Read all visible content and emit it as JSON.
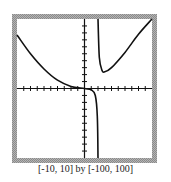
{
  "chart_data": {
    "type": "line",
    "title": "",
    "xlabel": "",
    "ylabel": "",
    "xlim": [
      -10,
      10
    ],
    "ylim": [
      -100,
      100
    ],
    "window_caption": "[-10, 10] by [-100, 100]",
    "x_tick_step": 1,
    "y_tick_step": 10,
    "grid": false,
    "vertical_asymptote_x": 2,
    "series": [
      {
        "name": "left-branch",
        "points": [
          [
            -10,
            77
          ],
          [
            -8,
            50
          ],
          [
            -6,
            28
          ],
          [
            -4,
            12
          ],
          [
            -2,
            3
          ],
          [
            0,
            0
          ],
          [
            1,
            -2
          ],
          [
            1.6,
            -10
          ],
          [
            1.9,
            -40
          ],
          [
            2,
            -100
          ]
        ]
      },
      {
        "name": "right-branch",
        "points": [
          [
            2,
            100
          ],
          [
            2.2,
            45
          ],
          [
            2.6,
            26
          ],
          [
            3,
            24
          ],
          [
            4,
            30
          ],
          [
            6,
            52
          ],
          [
            8,
            78
          ],
          [
            10,
            100
          ]
        ]
      }
    ]
  }
}
